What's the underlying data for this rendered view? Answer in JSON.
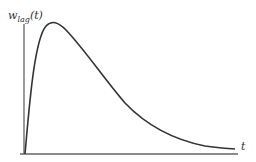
{
  "diagram": {
    "y_label": {
      "base": "w",
      "subscript": "lag",
      "suffix": "(t)"
    },
    "x_label": "t",
    "curve_description": "Lag weight function rising sharply from zero to an early peak then decaying asymptotically toward zero",
    "colors": {
      "axis": "#555555",
      "curve": "#333333",
      "text": "#333333",
      "background": "#ffffff"
    }
  }
}
